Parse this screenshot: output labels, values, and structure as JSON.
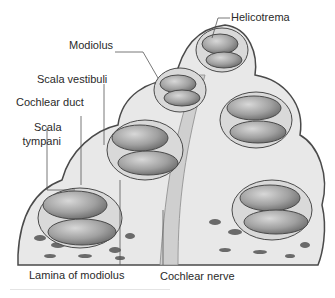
{
  "figure": {
    "labels": {
      "helicotrema": "Helicotrema",
      "modiolus": "Modiolus",
      "scala_vestibuli": "Scala vestibuli",
      "cochlear_duct": "Cochlear duct",
      "scala_tympani_line1": "Scala",
      "scala_tympani_line2": "tympani",
      "lamina_of_modiolus": "Lamina of modiolus",
      "cochlear_nerve": "Cochlear nerve"
    },
    "colors": {
      "background": "#ffffff",
      "outline": "#4a4a4a",
      "tissue": "#e6e6e6",
      "chamber": "#9a9a9a",
      "bone_dark": "#5a5a5a",
      "label_text": "#2a2a2a"
    }
  }
}
